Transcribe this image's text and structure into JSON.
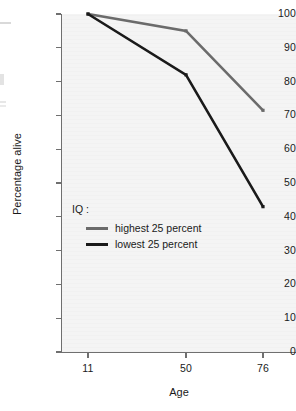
{
  "chart_data": {
    "type": "line",
    "title": "",
    "xlabel": "Age",
    "ylabel": "Percentage alive",
    "x": [
      11,
      50,
      76
    ],
    "xtick_labels": [
      "11",
      "50",
      "76"
    ],
    "ytick_labels": [
      "100",
      "90",
      "80",
      "70",
      "60",
      "50",
      "40",
      "30",
      "20",
      "10",
      "0"
    ],
    "ylim": [
      0,
      100
    ],
    "ystep": 10,
    "grid": false,
    "legend_position": "inside-left",
    "legend_title": "IQ :",
    "series": [
      {
        "name": "highest 25 percent",
        "values": [
          100,
          95,
          71.5
        ],
        "color": "#6b6b6b"
      },
      {
        "name": "lowest 25 percent",
        "values": [
          100,
          82,
          43
        ],
        "color": "#1a1a1a"
      }
    ]
  },
  "style": {
    "plot_background": "#f4f4f4",
    "axis_color": "#6f6f6f",
    "text_color": "#1a1a1a"
  }
}
